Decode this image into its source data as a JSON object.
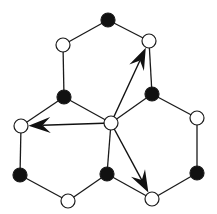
{
  "diagram": {
    "title": "",
    "colors": {
      "background": "#ffffff",
      "line": "#1a1a1a",
      "black_node": "#111111",
      "white_node_fill": "#ffffff",
      "arrow": "#111111"
    },
    "node_radius": 7,
    "nodes": [
      {
        "id": "center",
        "type": "white",
        "x": 111,
        "y": 123
      },
      {
        "id": "top",
        "type": "black",
        "x": 108,
        "y": 20
      },
      {
        "id": "top-left",
        "type": "white",
        "x": 63,
        "y": 45
      },
      {
        "id": "top-right",
        "type": "white",
        "x": 149,
        "y": 41
      },
      {
        "id": "upper-left-mid",
        "type": "black",
        "x": 64,
        "y": 97
      },
      {
        "id": "upper-right-mid",
        "type": "black",
        "x": 152,
        "y": 94
      },
      {
        "id": "left",
        "type": "white",
        "x": 21,
        "y": 126
      },
      {
        "id": "right",
        "type": "white",
        "x": 197,
        "y": 118
      },
      {
        "id": "bottom-left",
        "type": "black",
        "x": 20,
        "y": 175
      },
      {
        "id": "bottom-left-low",
        "type": "white",
        "x": 68,
        "y": 201
      },
      {
        "id": "bottom-mid",
        "type": "black",
        "x": 107,
        "y": 174
      },
      {
        "id": "bottom-right-low",
        "type": "white",
        "x": 152,
        "y": 199
      },
      {
        "id": "bottom-right",
        "type": "black",
        "x": 197,
        "y": 173
      }
    ],
    "edges": [
      [
        "top",
        "top-left"
      ],
      [
        "top",
        "top-right"
      ],
      [
        "top-left",
        "upper-left-mid"
      ],
      [
        "top-right",
        "upper-right-mid"
      ],
      [
        "upper-left-mid",
        "center"
      ],
      [
        "upper-right-mid",
        "center"
      ],
      [
        "upper-left-mid",
        "left"
      ],
      [
        "upper-right-mid",
        "right"
      ],
      [
        "left",
        "bottom-left"
      ],
      [
        "right",
        "bottom-right"
      ],
      [
        "bottom-left",
        "bottom-left-low"
      ],
      [
        "bottom-left-low",
        "bottom-mid"
      ],
      [
        "bottom-mid",
        "center"
      ],
      [
        "bottom-mid",
        "bottom-right-low"
      ],
      [
        "bottom-right-low",
        "bottom-right"
      ]
    ],
    "arrows": [
      {
        "from": "center",
        "to": "top-right",
        "label": "arrow-up-right"
      },
      {
        "from": "center",
        "to": "left",
        "label": "arrow-left"
      },
      {
        "from": "center",
        "to": "bottom-right-low",
        "label": "arrow-down-right"
      }
    ]
  }
}
